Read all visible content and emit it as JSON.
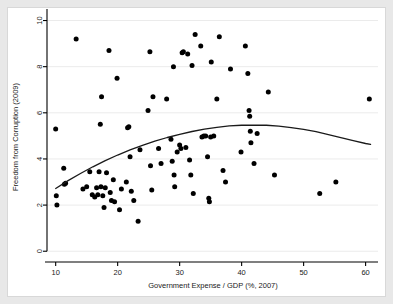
{
  "figure": {
    "background_color": "#e8e8e8",
    "panel_color": "#ffffff",
    "marker_color": "#000000",
    "curve_color": "#1a1a1a",
    "grid_color": "#ebebeb",
    "axis_color": "#000000"
  },
  "chart_data": {
    "type": "scatter",
    "title": "",
    "xlabel": "Government Expense / GDP (%, 2007)",
    "ylabel": "Freedom from Corruption (2009)",
    "xlim": [
      8.6,
      62.0
    ],
    "ylim": [
      -0.25,
      10.5
    ],
    "xticks": [
      10,
      20,
      30,
      40,
      50,
      60
    ],
    "xtick_labels": [
      "10",
      "20",
      "30",
      "40",
      "50",
      "60"
    ],
    "yticks": [
      0,
      2,
      4,
      6,
      8,
      10
    ],
    "ytick_labels": [
      "0",
      "2",
      "4",
      "6",
      "8",
      "10"
    ],
    "grid": "horizontal",
    "legend": "none",
    "points": [
      [
        10.0,
        5.3
      ],
      [
        10.1,
        2.4
      ],
      [
        10.2,
        2.0
      ],
      [
        11.3,
        3.6
      ],
      [
        11.4,
        2.9
      ],
      [
        11.6,
        2.95
      ],
      [
        13.3,
        9.2
      ],
      [
        14.4,
        2.7
      ],
      [
        15.0,
        2.8
      ],
      [
        15.5,
        3.45
      ],
      [
        15.9,
        2.45
      ],
      [
        16.3,
        2.35
      ],
      [
        16.6,
        2.75
      ],
      [
        16.8,
        2.45
      ],
      [
        17.0,
        3.45
      ],
      [
        17.2,
        5.5
      ],
      [
        17.3,
        2.8
      ],
      [
        17.4,
        6.7
      ],
      [
        17.6,
        2.4
      ],
      [
        17.8,
        1.9
      ],
      [
        18.0,
        2.75
      ],
      [
        18.2,
        3.4
      ],
      [
        18.6,
        8.7
      ],
      [
        18.8,
        2.55
      ],
      [
        19.0,
        2.2
      ],
      [
        19.3,
        3.1
      ],
      [
        19.5,
        2.15
      ],
      [
        19.9,
        7.5
      ],
      [
        20.3,
        1.8
      ],
      [
        20.6,
        2.7
      ],
      [
        21.4,
        3.0
      ],
      [
        21.6,
        5.35
      ],
      [
        21.8,
        5.4
      ],
      [
        22.0,
        4.1
      ],
      [
        22.2,
        2.6
      ],
      [
        22.6,
        2.2
      ],
      [
        23.3,
        1.3
      ],
      [
        23.6,
        4.4
      ],
      [
        24.9,
        6.1
      ],
      [
        25.2,
        8.65
      ],
      [
        25.3,
        3.7
      ],
      [
        25.5,
        2.65
      ],
      [
        25.7,
        6.7
      ],
      [
        26.6,
        4.45
      ],
      [
        27.0,
        3.8
      ],
      [
        27.9,
        6.6
      ],
      [
        28.6,
        4.85
      ],
      [
        28.8,
        3.9
      ],
      [
        29.0,
        8.0
      ],
      [
        29.1,
        3.3
      ],
      [
        29.2,
        2.8
      ],
      [
        29.6,
        4.3
      ],
      [
        30.0,
        4.6
      ],
      [
        30.2,
        4.45
      ],
      [
        30.4,
        8.6
      ],
      [
        30.6,
        8.65
      ],
      [
        31.0,
        4.5
      ],
      [
        31.3,
        8.55
      ],
      [
        31.6,
        3.95
      ],
      [
        31.8,
        3.3
      ],
      [
        32.0,
        8.05
      ],
      [
        32.2,
        2.5
      ],
      [
        32.5,
        9.4
      ],
      [
        33.4,
        8.9
      ],
      [
        33.6,
        4.95
      ],
      [
        33.9,
        5.0
      ],
      [
        34.2,
        5.0
      ],
      [
        34.5,
        4.1
      ],
      [
        34.7,
        2.3
      ],
      [
        34.8,
        2.15
      ],
      [
        35.0,
        4.95
      ],
      [
        35.1,
        8.2
      ],
      [
        35.5,
        5.0
      ],
      [
        36.0,
        6.6
      ],
      [
        36.4,
        9.3
      ],
      [
        37.0,
        3.5
      ],
      [
        37.4,
        3.0
      ],
      [
        38.2,
        7.9
      ],
      [
        39.9,
        4.3
      ],
      [
        40.6,
        8.9
      ],
      [
        41.0,
        7.7
      ],
      [
        41.2,
        6.1
      ],
      [
        41.3,
        5.85
      ],
      [
        41.4,
        5.2
      ],
      [
        41.5,
        4.7
      ],
      [
        42.0,
        3.8
      ],
      [
        42.5,
        5.1
      ],
      [
        44.3,
        6.9
      ],
      [
        45.3,
        3.3
      ],
      [
        52.6,
        2.5
      ],
      [
        55.2,
        3.0
      ],
      [
        60.6,
        6.6
      ]
    ],
    "fit_curve": {
      "kind": "quadratic",
      "label": "",
      "points": [
        [
          10.0,
          2.72
        ],
        [
          12.0,
          3.06
        ],
        [
          14.0,
          3.37
        ],
        [
          16.0,
          3.66
        ],
        [
          18.0,
          3.93
        ],
        [
          20.0,
          4.17
        ],
        [
          22.0,
          4.39
        ],
        [
          24.0,
          4.59
        ],
        [
          26.0,
          4.77
        ],
        [
          28.0,
          4.93
        ],
        [
          30.0,
          5.07
        ],
        [
          32.0,
          5.19
        ],
        [
          34.0,
          5.29
        ],
        [
          36.0,
          5.37
        ],
        [
          38.0,
          5.43
        ],
        [
          40.0,
          5.46
        ],
        [
          42.0,
          5.47
        ],
        [
          44.0,
          5.46
        ],
        [
          46.0,
          5.42
        ],
        [
          48.0,
          5.36
        ],
        [
          50.0,
          5.28
        ],
        [
          52.0,
          5.18
        ],
        [
          54.0,
          5.05
        ],
        [
          56.0,
          4.92
        ],
        [
          58.0,
          4.79
        ],
        [
          60.0,
          4.67
        ],
        [
          60.8,
          4.63
        ]
      ]
    }
  }
}
